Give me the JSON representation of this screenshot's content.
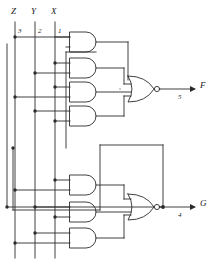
{
  "figure": {
    "type": "logic-circuit-schematic",
    "title": "",
    "line_color": "#2b2b2b",
    "background": "#ffffff"
  },
  "inputs": [
    {
      "id": "Z",
      "label": "Z",
      "pin": "3",
      "x": 15
    },
    {
      "id": "Y",
      "label": "Y",
      "pin": "2",
      "x": 35
    },
    {
      "id": "X",
      "label": "X",
      "pin": "1",
      "x": 55
    }
  ],
  "outputs": [
    {
      "id": "F",
      "label": "F",
      "pin": "5",
      "gate": "nor-1"
    },
    {
      "id": "G",
      "label": "G",
      "pin": "4",
      "gate": "nor-2"
    }
  ],
  "gates": [
    {
      "id": "and-1",
      "type": "AND",
      "group": "top",
      "cy": 42
    },
    {
      "id": "and-2",
      "type": "AND",
      "group": "top",
      "cy": 68
    },
    {
      "id": "and-3",
      "type": "AND",
      "group": "top",
      "cy": 92
    },
    {
      "id": "and-4",
      "type": "AND",
      "group": "top",
      "cy": 116
    },
    {
      "id": "nor-1",
      "type": "NOR",
      "group": "top",
      "cy": 89,
      "bubble": true
    },
    {
      "id": "and-5",
      "type": "AND",
      "group": "bottom",
      "cy": 185
    },
    {
      "id": "and-6",
      "type": "AND",
      "group": "bottom",
      "cy": 212
    },
    {
      "id": "and-7",
      "type": "AND",
      "group": "bottom",
      "cy": 238
    },
    {
      "id": "nor-2",
      "type": "NOR",
      "group": "bottom",
      "cy": 207,
      "bubble": true
    }
  ],
  "legend": {
    "and_symbol": "AND gate",
    "nor_symbol": "NOR gate with inversion bubble"
  }
}
